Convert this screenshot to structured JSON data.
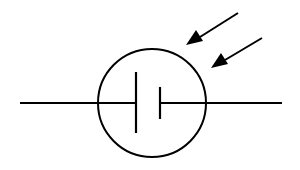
{
  "diagram": {
    "symbol": "photovoltaic-cell",
    "colors": {
      "stroke": "#000000",
      "background": "#ffffff"
    },
    "elements": {
      "lead_left": {
        "x1": 20,
        "y1": 103,
        "x2": 136,
        "y2": 103
      },
      "lead_right": {
        "x1": 160,
        "y1": 103,
        "x2": 282,
        "y2": 103
      },
      "circle": {
        "cx": 152,
        "cy": 103,
        "r": 54
      },
      "long_plate": {
        "x": 136,
        "y1": 72,
        "y2": 133
      },
      "short_plate": {
        "x": 160,
        "y1": 87,
        "y2": 119
      },
      "arrows": [
        {
          "x1": 238,
          "y1": 13,
          "x2": 186,
          "y2": 45
        },
        {
          "x1": 262,
          "y1": 38,
          "x2": 211,
          "y2": 68
        }
      ]
    }
  }
}
